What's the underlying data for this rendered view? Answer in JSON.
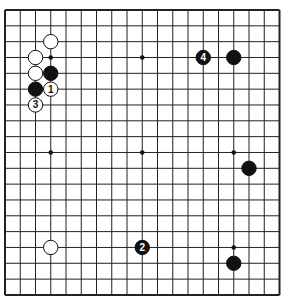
{
  "diagram": {
    "type": "go-board",
    "size": 19,
    "origin": {
      "x": 5,
      "y": 10
    },
    "spacing": {
      "x": 15.25,
      "y": 15.83
    },
    "colors": {
      "line": "#222222",
      "black": "#111111",
      "white": "#ffffff",
      "background": "#ffffff"
    },
    "star_points": [
      [
        3,
        3
      ],
      [
        9,
        3
      ],
      [
        15,
        3
      ],
      [
        3,
        9
      ],
      [
        9,
        9
      ],
      [
        15,
        9
      ],
      [
        3,
        15
      ],
      [
        9,
        15
      ],
      [
        15,
        15
      ]
    ],
    "stones": [
      {
        "col": 3,
        "row": 2,
        "color": "white",
        "label": ""
      },
      {
        "col": 2,
        "row": 3,
        "color": "white",
        "label": ""
      },
      {
        "col": 2,
        "row": 4,
        "color": "white",
        "label": ""
      },
      {
        "col": 3,
        "row": 4,
        "color": "black",
        "label": ""
      },
      {
        "col": 2,
        "row": 5,
        "color": "black",
        "label": ""
      },
      {
        "col": 3,
        "row": 5,
        "color": "white",
        "label": "1"
      },
      {
        "col": 2,
        "row": 6,
        "color": "white",
        "label": "3"
      },
      {
        "col": 13,
        "row": 3,
        "color": "black",
        "label": "4"
      },
      {
        "col": 15,
        "row": 3,
        "color": "black",
        "label": ""
      },
      {
        "col": 16,
        "row": 10,
        "color": "black",
        "label": ""
      },
      {
        "col": 3,
        "row": 15,
        "color": "white",
        "label": ""
      },
      {
        "col": 9,
        "row": 15,
        "color": "black",
        "label": "2"
      },
      {
        "col": 15,
        "row": 16,
        "color": "black",
        "label": ""
      }
    ]
  }
}
